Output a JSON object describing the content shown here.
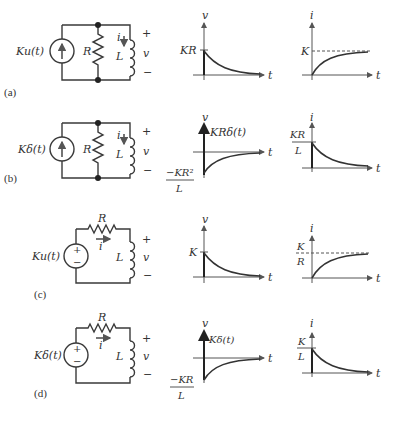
{
  "figure": {
    "rows": [
      {
        "label": "(a)",
        "source": "Ku(t)",
        "source_type": "current-source",
        "topology": "parallel RL",
        "components": {
          "resistor": "R",
          "inductor": "L",
          "current": "i",
          "voltage": "v",
          "plus": "+",
          "minus": "−"
        },
        "v_graph": {
          "ylabel": "v",
          "xlabel": "t",
          "marker": "KR",
          "shape": "exponential decay from KR to 0"
        },
        "i_graph": {
          "ylabel": "i",
          "xlabel": "t",
          "marker": "K",
          "shape": "exponential rise from 0 to K (dashed asymptote)"
        }
      },
      {
        "label": "(b)",
        "source": "Kδ(t)",
        "source_type": "current-source",
        "topology": "parallel RL",
        "components": {
          "resistor": "R",
          "inductor": "L",
          "current": "i",
          "voltage": "v",
          "plus": "+",
          "minus": "−"
        },
        "v_graph": {
          "ylabel": "v",
          "xlabel": "t",
          "impulse": "KRδ(t)",
          "marker_num": "−KR²",
          "marker_den": "L",
          "shape": "impulse then exponential rise from −KR²/L to 0"
        },
        "i_graph": {
          "ylabel": "i",
          "xlabel": "t",
          "marker_num": "KR",
          "marker_den": "L",
          "shape": "exponential decay from KR/L to 0"
        }
      },
      {
        "label": "(c)",
        "source": "Ku(t)",
        "source_type": "voltage-source",
        "topology": "series RL",
        "components": {
          "resistor": "R",
          "inductor": "L",
          "current": "i",
          "voltage": "v",
          "plus": "+",
          "minus": "−"
        },
        "v_graph": {
          "ylabel": "v",
          "xlabel": "t",
          "marker": "K",
          "shape": "exponential decay from K to 0"
        },
        "i_graph": {
          "ylabel": "i",
          "xlabel": "t",
          "marker_num": "K",
          "marker_den": "R",
          "shape": "exponential rise from 0 to K/R (dashed asymptote)"
        }
      },
      {
        "label": "(d)",
        "source": "Kδ(t)",
        "source_type": "voltage-source",
        "topology": "series RL",
        "components": {
          "resistor": "R",
          "inductor": "L",
          "current": "i",
          "voltage": "v",
          "plus": "+",
          "minus": "−"
        },
        "v_graph": {
          "ylabel": "v",
          "xlabel": "t",
          "impulse": "Kδ(t)",
          "marker_num": "−KR",
          "marker_den": "L",
          "shape": "impulse then exponential rise from −KR/L to 0"
        },
        "i_graph": {
          "ylabel": "i",
          "xlabel": "t",
          "marker_num": "K",
          "marker_den": "L",
          "shape": "exponential decay from K/L to 0"
        }
      }
    ]
  }
}
